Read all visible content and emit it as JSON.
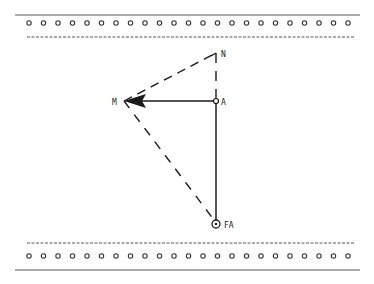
{
  "labels": {
    "n": "N",
    "a": "A",
    "m": "M",
    "fa": "FA"
  },
  "colors": {
    "ink": "#1a1a1a",
    "background": "#ffffff"
  },
  "holes": {
    "top_count": 23,
    "bottom_count": 23
  }
}
